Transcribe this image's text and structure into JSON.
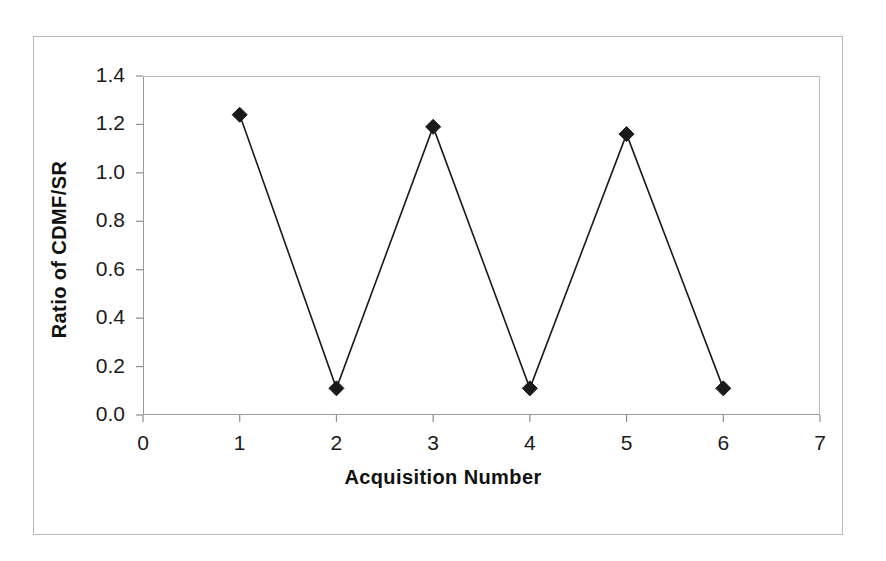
{
  "chart_data": {
    "type": "line",
    "title": "",
    "subtitle": "",
    "xlabel": "Acquisition Number",
    "ylabel": "Ratio of CDMF/SR",
    "x": [
      1,
      2,
      3,
      4,
      5,
      6
    ],
    "values": [
      1.24,
      0.11,
      1.19,
      0.11,
      1.16,
      0.11
    ],
    "series": [
      {
        "name": "Ratio of CDMF/SR",
        "x": [
          1,
          2,
          3,
          4,
          5,
          6
        ],
        "values": [
          1.24,
          0.11,
          1.19,
          0.11,
          1.16,
          0.11
        ]
      }
    ],
    "xlim": [
      0,
      7
    ],
    "ylim": [
      0,
      1.4
    ],
    "xticks": [
      "0",
      "1",
      "2",
      "3",
      "4",
      "5",
      "6",
      "7"
    ],
    "xtick_values": [
      0,
      1,
      2,
      3,
      4,
      5,
      6,
      7
    ],
    "yticks": [
      "0.0",
      "0.2",
      "0.4",
      "0.6",
      "0.8",
      "1.0",
      "1.2",
      "1.4"
    ],
    "ytick_values": [
      0.0,
      0.2,
      0.4,
      0.6,
      0.8,
      1.0,
      1.2,
      1.4
    ],
    "grid": false,
    "legend": false,
    "legend_position": "none",
    "marker": "diamond",
    "marker_color": "#1a1a1a",
    "line_color": "#1a1a1a",
    "axis_color": "#8c8c8c",
    "background_color": "#ffffff",
    "border_color": "#b9b9b9"
  }
}
